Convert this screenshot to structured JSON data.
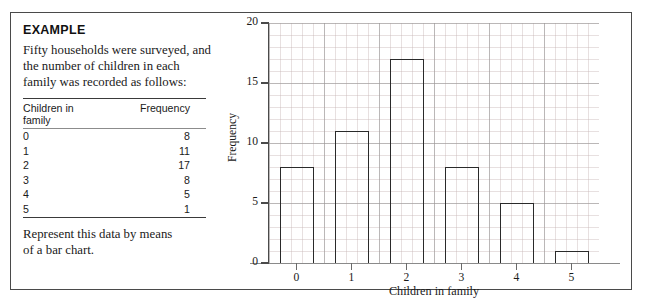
{
  "example": {
    "heading": "EXAMPLE",
    "intro_lines": [
      "Fifty households were surveyed, and",
      "the number of children in each",
      "family was recorded as follows:"
    ],
    "closing_lines": [
      "Represent this data by means",
      "of a bar chart."
    ]
  },
  "table": {
    "header_category_line1": "Children in",
    "header_category_line2": "family",
    "header_frequency": "Frequency",
    "rows": [
      {
        "category": "0",
        "frequency": "8"
      },
      {
        "category": "1",
        "frequency": "11"
      },
      {
        "category": "2",
        "frequency": "17"
      },
      {
        "category": "3",
        "frequency": "8"
      },
      {
        "category": "4",
        "frequency": "5"
      },
      {
        "category": "5",
        "frequency": "1"
      }
    ]
  },
  "chart_data": {
    "type": "bar",
    "title": "",
    "categories": [
      "0",
      "1",
      "2",
      "3",
      "4",
      "5"
    ],
    "values": [
      8,
      11,
      17,
      8,
      5,
      1
    ],
    "xlabel": "Children in family",
    "ylabel": "Frequency",
    "ylim": [
      0,
      20
    ],
    "ytick_labels": [
      "0",
      "5",
      "10",
      "15",
      "20"
    ],
    "ytick_values": [
      0,
      5,
      10,
      15,
      20
    ],
    "grid": true,
    "legend": "none",
    "bar_style": "outline",
    "colors": {
      "bar_outline": "#2a2a2a",
      "bar_fill": "none",
      "axis": "#4a4a4a",
      "major_grid": "#969696",
      "minor_grid": "#c4b2b2"
    }
  }
}
